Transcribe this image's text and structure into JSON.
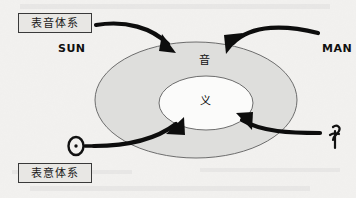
{
  "diagram": {
    "title_chars": {
      "outer_ring_char": "音",
      "inner_core_char": "义"
    },
    "labels": {
      "phonographic_system": "表音体系",
      "ideographic_system": "表意体系",
      "sun_word": "SUN",
      "man_word": "MAN"
    },
    "pictographs": {
      "sun_glyph_name": "ancient-sun-pictograph",
      "man_glyph_name": "ancient-man-pictograph"
    },
    "arrows": [
      {
        "name": "arrow-phonographic-to-sound-left",
        "from": "表音体系",
        "to": "音"
      },
      {
        "name": "arrow-man-to-sound-right",
        "from": "MAN",
        "to": "音"
      },
      {
        "name": "arrow-ideographic-to-meaning-left",
        "from": "表意体系",
        "to": "义"
      },
      {
        "name": "arrow-man-pictograph-to-meaning-right",
        "from": "ancient-man-pictograph",
        "to": "义"
      }
    ],
    "colors": {
      "background": "#f2f1ef",
      "outer_ellipse_fill": "#dededc",
      "inner_ellipse_fill": "#fbfbfa",
      "ellipse_stroke": "#6d6d6d",
      "arrow_color": "#0d0d0d",
      "label_box_fill": "#e8e7e4",
      "label_box_border": "#3a3a3a",
      "text_color": "#111111"
    },
    "geometry": {
      "outer_ellipse": {
        "cx": 196,
        "cy": 100,
        "rx": 101,
        "ry": 58
      },
      "inner_ellipse": {
        "cx": 206,
        "cy": 103,
        "rx": 47,
        "ry": 27
      }
    }
  }
}
